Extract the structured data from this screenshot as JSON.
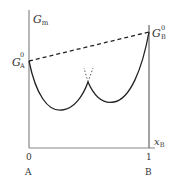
{
  "diagram": {
    "type": "gibbs-energy-composition",
    "y_axis_label": "G",
    "y_axis_label_sub": "m",
    "x_axis_label": "x",
    "x_axis_label_sub": "B",
    "point_A_label": "G",
    "point_A_sup": "0",
    "point_A_sub": "A",
    "point_B_label": "G",
    "point_B_sup": "0",
    "point_B_sub": "B",
    "x_tick_left": "0",
    "x_tick_right": "1",
    "component_left": "A",
    "component_right": "B",
    "colors": {
      "axis": "#888888",
      "curve": "#222222",
      "dashed": "#222222",
      "text": "#333333"
    }
  }
}
